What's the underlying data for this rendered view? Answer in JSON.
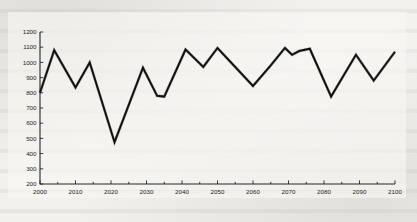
{
  "page": {
    "background_color": "#f2f1ee",
    "figure_background_color": "#f8f7f4",
    "ink_color": "#111111",
    "document_type": "scanned-page-figure"
  },
  "chart_data": {
    "type": "line",
    "title": "",
    "subtitle": "",
    "xlabel": "",
    "ylabel": "",
    "xlim": [
      2000,
      2100
    ],
    "ylim": [
      200,
      1200
    ],
    "grid": false,
    "legend": null,
    "legend_position": "none",
    "y_ticks": [
      200,
      300,
      400,
      500,
      600,
      700,
      800,
      900,
      1000,
      1100,
      1200
    ],
    "y_tick_labels": [
      "200",
      "300",
      "400",
      "500",
      "600",
      "700",
      "800",
      "900",
      "1000",
      "1100",
      "1200"
    ],
    "x_ticks_major": [
      2000,
      2010,
      2020,
      2030,
      2040,
      2050,
      2060,
      2070,
      2080,
      2090,
      2100
    ],
    "x_tick_labels": [
      "2000",
      "2010",
      "2020",
      "2030",
      "2040",
      "2050",
      "2060",
      "2070",
      "2080",
      "2090",
      "2100"
    ],
    "x_ticks_minor_step": 5,
    "series": [
      {
        "name": "series-1",
        "color": "#111111",
        "x": [
          2000,
          2004,
          2010,
          2014,
          2021,
          2029,
          2033,
          2035,
          2041,
          2046,
          2050,
          2060,
          2065,
          2069,
          2071,
          2073,
          2076,
          2082,
          2089,
          2094,
          2100
        ],
        "values": [
          800,
          1080,
          835,
          1000,
          475,
          965,
          780,
          775,
          1085,
          970,
          1095,
          845,
          980,
          1095,
          1050,
          1075,
          1090,
          775,
          1050,
          880,
          1070
        ]
      }
    ]
  }
}
